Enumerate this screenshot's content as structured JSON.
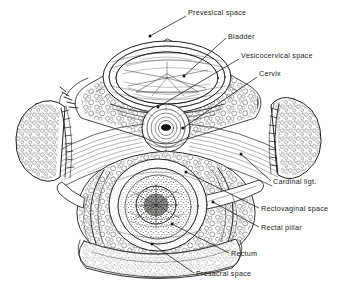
{
  "figure": {
    "kind": "anatomical-illustration",
    "background_color": "#ffffff",
    "ink_color": "#1a1a1a",
    "style": "black-and-white pen-and-ink line drawing with stippled fat tissue"
  },
  "labels": [
    {
      "id": "prevesical",
      "text": "Prevesical space",
      "x": 188,
      "y": 15,
      "anchor": "start",
      "leader": [
        [
          186,
          16
        ],
        [
          150,
          36
        ]
      ],
      "dot": [
        150,
        36
      ]
    },
    {
      "id": "bladder",
      "text": "Bladder",
      "x": 228,
      "y": 39,
      "anchor": "start",
      "leader": [
        [
          226,
          38
        ],
        [
          184,
          76
        ]
      ],
      "dot": [
        184,
        76
      ]
    },
    {
      "id": "vesicocervical",
      "text": "Vesicocervical space",
      "x": 241,
      "y": 58,
      "anchor": "start",
      "leader": [
        [
          239,
          59
        ],
        [
          158,
          107
        ]
      ],
      "dot": [
        158,
        107
      ]
    },
    {
      "id": "cervix",
      "text": "Cervix",
      "x": 259,
      "y": 76,
      "anchor": "start",
      "leader": [
        [
          257,
          77
        ],
        [
          183,
          128
        ]
      ],
      "dot": [
        183,
        128
      ]
    },
    {
      "id": "cardinal",
      "text": "Cardinal ligt.",
      "x": 273,
      "y": 184,
      "anchor": "start",
      "leader": [
        [
          271,
          181
        ],
        [
          241,
          154
        ]
      ],
      "dot": [
        241,
        154
      ]
    },
    {
      "id": "rectovaginal",
      "text": "Rectovaginal space",
      "x": 261,
      "y": 211,
      "anchor": "start",
      "leader": [
        [
          259,
          208
        ],
        [
          186,
          172
        ]
      ],
      "dot": [
        186,
        172
      ]
    },
    {
      "id": "rectalpillar",
      "text": "Rectal pillar",
      "x": 261,
      "y": 230,
      "anchor": "start",
      "leader": [
        [
          259,
          227
        ],
        [
          213,
          202
        ]
      ],
      "dot": [
        213,
        202
      ]
    },
    {
      "id": "rectum",
      "text": "Rectum",
      "x": 231,
      "y": 256,
      "anchor": "start",
      "leader": [
        [
          229,
          253
        ],
        [
          172,
          224
        ]
      ],
      "dot": [
        172,
        224
      ]
    },
    {
      "id": "presacral",
      "text": "Presacral space",
      "x": 196,
      "y": 276,
      "anchor": "start",
      "leader": [
        [
          194,
          273
        ],
        [
          152,
          244
        ]
      ],
      "dot": [
        152,
        244
      ]
    }
  ],
  "structures": [
    {
      "name": "bladder",
      "description": "large oval organ, upper centre, concentric muscular wall layers with radiating internal folds"
    },
    {
      "name": "cervix",
      "description": "small concentric ring structure with dark central canal, mid centre"
    },
    {
      "name": "rectum",
      "description": "thick-walled circular organ with dense stippled lumen, lower centre"
    },
    {
      "name": "left-lateral-mass",
      "description": "rounded teardrop mass of stippled tissue at left margin"
    },
    {
      "name": "right-lateral-mass",
      "description": "rounded triangular mass of stippled tissue at right margin"
    },
    {
      "name": "cardinal-ligament-fibres",
      "description": "fan of parallel curved fibres radiating laterally from the cervix to both pelvic side walls"
    },
    {
      "name": "presacral-band",
      "description": "curved stippled band across the bottom of the section"
    }
  ]
}
